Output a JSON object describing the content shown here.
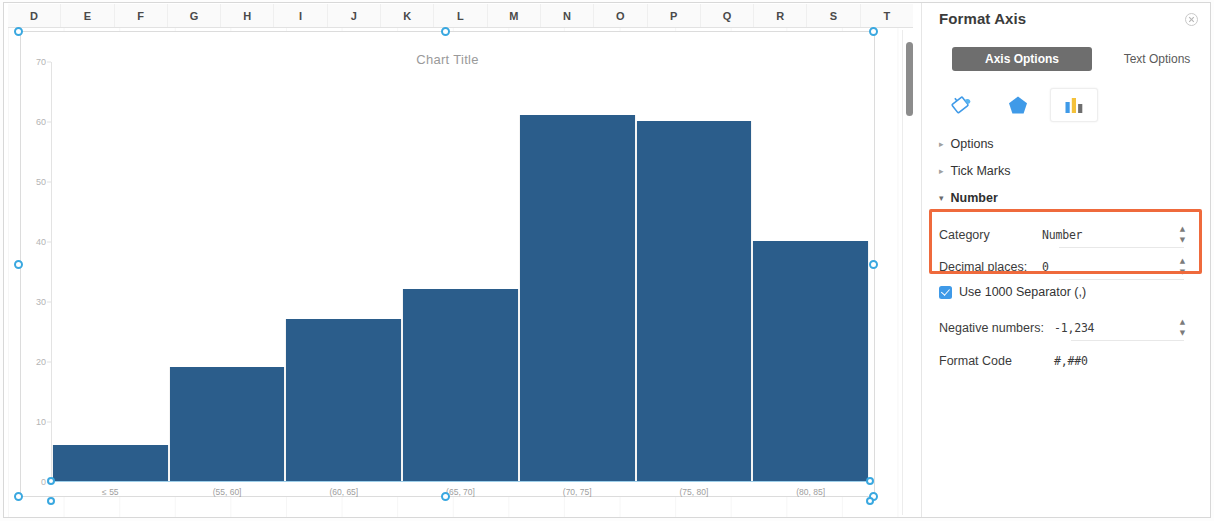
{
  "spreadsheet": {
    "columns": [
      "D",
      "E",
      "F",
      "G",
      "H",
      "I",
      "J",
      "K",
      "L",
      "M",
      "N",
      "O",
      "P",
      "Q",
      "R",
      "S",
      "T"
    ]
  },
  "chart_data": {
    "type": "bar",
    "title": "Chart Title",
    "categories": [
      "≤ 55",
      "(55, 60]",
      "(60, 65]",
      "(65, 70]",
      "(70, 75]",
      "(75, 80]",
      "(80, 85]"
    ],
    "values": [
      6,
      19,
      27,
      32,
      61,
      60,
      40
    ],
    "xlabel": "",
    "ylabel": "",
    "ylim": [
      0,
      70
    ],
    "yticks": [
      0,
      10,
      20,
      30,
      40,
      50,
      60,
      70
    ],
    "grid": false,
    "legend": false,
    "series_color": "#2b5d8b"
  },
  "pane": {
    "title": "Format Axis",
    "close_label": "✕",
    "tabs": [
      {
        "label": "Axis Options",
        "active": true
      },
      {
        "label": "Text Options",
        "active": false
      }
    ],
    "icons": [
      {
        "name": "fill-bucket-icon",
        "selected": false
      },
      {
        "name": "effects-pentagon-icon",
        "selected": false
      },
      {
        "name": "axis-chart-icon",
        "selected": true
      }
    ],
    "sections": [
      {
        "label": "Options",
        "expanded": false
      },
      {
        "label": "Tick Marks",
        "expanded": false
      },
      {
        "label": "Number",
        "expanded": true
      }
    ],
    "number": {
      "category_label": "Category",
      "category_value": "Number",
      "decimal_label": "Decimal places:",
      "decimal_value": "0",
      "separator_label": "Use 1000 Separator (,)",
      "separator_checked": true,
      "negative_label": "Negative numbers:",
      "negative_value": "-1,234",
      "format_code_label": "Format Code",
      "format_code_value": "#,##0"
    },
    "highlight_color": "#ef6a3c"
  }
}
